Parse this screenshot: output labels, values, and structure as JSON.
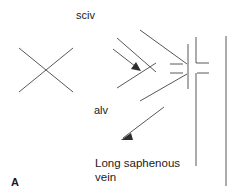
{
  "figure": {
    "panel_letter": "A",
    "caption_line1": "Long saphenous",
    "caption_line2": "vein",
    "label_sciv": "sciv",
    "label_alv": "alv",
    "background_color": "#ffffff",
    "line_color": "#58585a",
    "text_color": "#1b1b1b"
  },
  "diagram": {
    "crossed_lines": {
      "name": "crossed-out-vessels",
      "stroke1": {
        "x1": 19,
        "y1": 48,
        "x2": 73,
        "y2": 92
      },
      "stroke2": {
        "x1": 19,
        "y1": 92,
        "x2": 73,
        "y2": 48
      }
    },
    "tributary_upper": {
      "x1": 140,
      "y1": 30,
      "x2": 186,
      "y2": 64
    },
    "tributary_upper_inner": {
      "x1": 117,
      "y1": 38,
      "x2": 155,
      "y2": 72
    },
    "tributary_lower_inner": {
      "x1": 117,
      "y1": 88,
      "x2": 155,
      "y2": 64
    },
    "tributary_lower": {
      "x1": 140,
      "y1": 100,
      "x2": 186,
      "y2": 74
    },
    "vein_wall": {
      "x1": 188,
      "y1": 45,
      "x2": 188,
      "y2": 88
    },
    "ostium_upper": {
      "x1": 196,
      "y1": 38,
      "x2": 196,
      "y2": 63
    },
    "ostium_upper_foot": {
      "x1": 196,
      "y1": 63,
      "x2": 208,
      "y2": 63
    },
    "ostium_lower": {
      "x1": 196,
      "y1": 72,
      "x2": 208,
      "y2": 72
    },
    "ostium_lower_leg": {
      "x1": 196,
      "y1": 72,
      "x2": 196,
      "y2": 166
    },
    "saphenous_far_wall": {
      "x1": 226,
      "y1": 36,
      "x2": 226,
      "y2": 186
    },
    "arrows": [
      {
        "name": "arrow-sciv-flow",
        "x1": 114,
        "y1": 50,
        "x2": 141,
        "y2": 71,
        "direction": "down-right"
      },
      {
        "name": "arrow-alv-flow",
        "x1": 163,
        "y1": 108,
        "x2": 122,
        "y2": 139,
        "direction": "down-left"
      }
    ]
  }
}
